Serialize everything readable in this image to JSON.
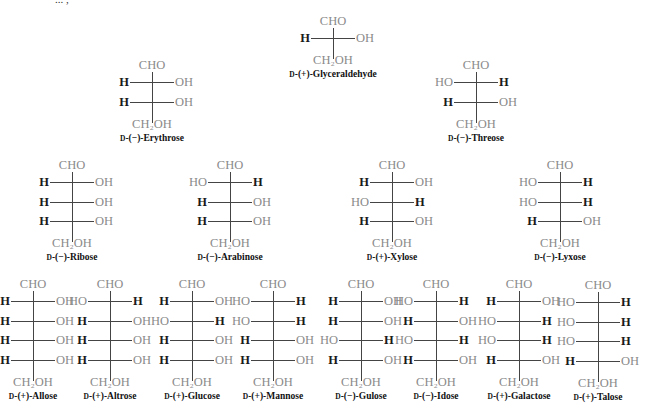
{
  "diagram": {
    "title_fragment": "... ,",
    "colors": {
      "substituent_H": "#1a1a1a",
      "substituent_OH": "#8a8a8a",
      "bond": "#444444",
      "label": "#111111"
    },
    "top_group": "CHO",
    "bottom_group": "CH₂OH",
    "sugars": [
      {
        "id": "glyceraldehyde",
        "config": "D",
        "rotation": "(+)",
        "name": "Glyceraldehyde",
        "x": 333,
        "y": 14,
        "rows": [
          [
            "H",
            "OH"
          ]
        ]
      },
      {
        "id": "erythrose",
        "config": "D",
        "rotation": "(−)",
        "name": "Erythrose",
        "x": 152,
        "y": 58,
        "rows": [
          [
            "H",
            "OH"
          ],
          [
            "H",
            "OH"
          ]
        ]
      },
      {
        "id": "threose",
        "config": "D",
        "rotation": "(−)",
        "name": "Threose",
        "x": 476,
        "y": 58,
        "rows": [
          [
            "HO",
            "H"
          ],
          [
            "H",
            "OH"
          ]
        ]
      },
      {
        "id": "ribose",
        "config": "D",
        "rotation": "(−)",
        "name": "Ribose",
        "x": 72,
        "y": 158,
        "rows": [
          [
            "H",
            "OH"
          ],
          [
            "H",
            "OH"
          ],
          [
            "H",
            "OH"
          ]
        ]
      },
      {
        "id": "arabinose",
        "config": "D",
        "rotation": "(−)",
        "name": "Arabinose",
        "x": 230,
        "y": 158,
        "rows": [
          [
            "HO",
            "H"
          ],
          [
            "H",
            "OH"
          ],
          [
            "H",
            "OH"
          ]
        ]
      },
      {
        "id": "xylose",
        "config": "D",
        "rotation": "(+)",
        "name": "Xylose",
        "x": 392,
        "y": 158,
        "rows": [
          [
            "H",
            "OH"
          ],
          [
            "HO",
            "H"
          ],
          [
            "H",
            "OH"
          ]
        ]
      },
      {
        "id": "lyxose",
        "config": "D",
        "rotation": "(−)",
        "name": "Lyxose",
        "x": 560,
        "y": 158,
        "rows": [
          [
            "HO",
            "H"
          ],
          [
            "HO",
            "H"
          ],
          [
            "H",
            "OH"
          ]
        ]
      },
      {
        "id": "allose",
        "config": "D",
        "rotation": "(+)",
        "name": "Allose",
        "x": 33,
        "y": 277,
        "rows": [
          [
            "H",
            "OH"
          ],
          [
            "H",
            "OH"
          ],
          [
            "H",
            "OH"
          ],
          [
            "H",
            "OH"
          ]
        ]
      },
      {
        "id": "altrose",
        "config": "D",
        "rotation": "(+)",
        "name": "Altrose",
        "x": 110,
        "y": 277,
        "rows": [
          [
            "HO",
            "H"
          ],
          [
            "H",
            "OH"
          ],
          [
            "H",
            "OH"
          ],
          [
            "H",
            "OH"
          ]
        ]
      },
      {
        "id": "glucose",
        "config": "D",
        "rotation": "(+)",
        "name": "Glucose",
        "x": 192,
        "y": 277,
        "rows": [
          [
            "H",
            "OH"
          ],
          [
            "HO",
            "H"
          ],
          [
            "H",
            "OH"
          ],
          [
            "H",
            "OH"
          ]
        ]
      },
      {
        "id": "mannose",
        "config": "D",
        "rotation": "(+)",
        "name": "Mannose",
        "x": 273,
        "y": 277,
        "rows": [
          [
            "HO",
            "H"
          ],
          [
            "HO",
            "H"
          ],
          [
            "H",
            "OH"
          ],
          [
            "H",
            "OH"
          ]
        ]
      },
      {
        "id": "gulose",
        "config": "D",
        "rotation": "(−)",
        "name": "Gulose",
        "x": 361,
        "y": 277,
        "rows": [
          [
            "H",
            "OH"
          ],
          [
            "H",
            "OH"
          ],
          [
            "HO",
            "H"
          ],
          [
            "H",
            "OH"
          ]
        ]
      },
      {
        "id": "idose",
        "config": "D",
        "rotation": "(−)",
        "name": "Idose",
        "x": 436,
        "y": 277,
        "rows": [
          [
            "HO",
            "H"
          ],
          [
            "H",
            "OH"
          ],
          [
            "HO",
            "H"
          ],
          [
            "H",
            "OH"
          ]
        ]
      },
      {
        "id": "galactose",
        "config": "D",
        "rotation": "(+)",
        "name": "Galactose",
        "x": 519,
        "y": 277,
        "rows": [
          [
            "H",
            "OH"
          ],
          [
            "HO",
            "H"
          ],
          [
            "HO",
            "H"
          ],
          [
            "H",
            "OH"
          ]
        ]
      },
      {
        "id": "talose",
        "config": "D",
        "rotation": "(+)",
        "name": "Talose",
        "x": 598,
        "y": 278,
        "rows": [
          [
            "HO",
            "H"
          ],
          [
            "HO",
            "H"
          ],
          [
            "HO",
            "H"
          ],
          [
            "H",
            "OH"
          ]
        ]
      }
    ]
  }
}
